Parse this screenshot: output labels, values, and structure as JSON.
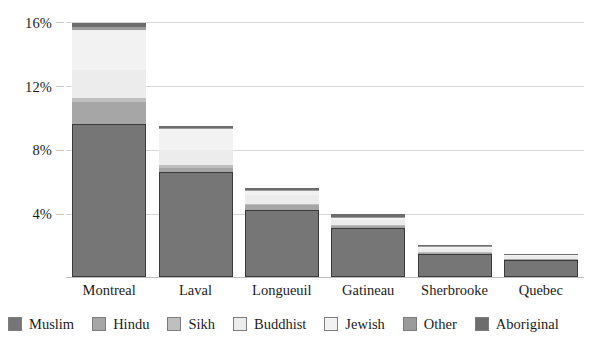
{
  "chart_data": {
    "type": "bar",
    "subtype": "stacked-bar",
    "title": "",
    "subtitle": "",
    "xlabel": "",
    "ylabel": "",
    "ylim": [
      0,
      16.8
    ],
    "ytick_values": [
      4,
      8,
      12,
      16
    ],
    "ytick_labels": [
      "4%",
      "8%",
      "12%",
      "16%"
    ],
    "grid": true,
    "legend_position": "bottom",
    "categories": [
      "Montreal",
      "Laval",
      "Longueuil",
      "Gatineau",
      "Sherbrooke",
      "Quebec"
    ],
    "series": [
      {
        "name": "Muslim",
        "color": "#767676",
        "values": [
          9.6,
          6.6,
          4.2,
          3.1,
          1.45,
          1.05
        ]
      },
      {
        "name": "Hindu",
        "color": "#a6a6a6",
        "values": [
          1.35,
          0.22,
          0.3,
          0.1,
          0.06,
          0.05
        ]
      },
      {
        "name": "Sikh",
        "color": "#bfbfbf",
        "values": [
          0.3,
          0.18,
          0.1,
          0.06,
          0.04,
          0.03
        ]
      },
      {
        "name": "Buddhist",
        "color": "#ececec",
        "values": [
          1.7,
          0.95,
          0.55,
          0.3,
          0.22,
          0.18
        ]
      },
      {
        "name": "Jewish",
        "color": "#f2f2f2",
        "values": [
          2.55,
          1.3,
          0.25,
          0.12,
          0.1,
          0.06
        ]
      },
      {
        "name": "Other",
        "color": "#9b9b9b",
        "values": [
          0.18,
          0.1,
          0.08,
          0.06,
          0.05,
          0.04
        ]
      },
      {
        "name": "Aboriginal",
        "color": "#6d6d6d",
        "values": [
          0.22,
          0.1,
          0.09,
          0.22,
          0.08,
          0.06
        ]
      }
    ]
  },
  "axis": {
    "y_ticks": [
      {
        "label": "16%",
        "value": 16
      },
      {
        "label": "12%",
        "value": 12
      },
      {
        "label": "8%",
        "value": 8
      },
      {
        "label": "4%",
        "value": 4
      }
    ]
  },
  "legend": {
    "items": [
      {
        "label": "Muslim",
        "color": "#767676"
      },
      {
        "label": "Hindu",
        "color": "#a6a6a6"
      },
      {
        "label": "Sikh",
        "color": "#bfbfbf"
      },
      {
        "label": "Buddhist",
        "color": "#ececec"
      },
      {
        "label": "Jewish",
        "color": "#f2f2f2"
      },
      {
        "label": "Other",
        "color": "#9b9b9b"
      },
      {
        "label": "Aboriginal",
        "color": "#6d6d6d"
      }
    ]
  }
}
